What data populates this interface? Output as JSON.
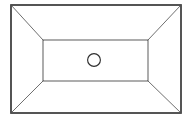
{
  "figure": {
    "background_color": "#ffffff",
    "width": 192,
    "height": 122,
    "line_color_outer": "#2b2b2b",
    "line_color_inner": "#4a4a4a",
    "line_color_taper": "#555555",
    "line_color_hole": "#2f2f2f"
  },
  "geometry": {
    "outer_rect": {
      "name": "outer-rim-rectangle",
      "x": 11,
      "y": 5,
      "width": 170,
      "height": 108,
      "corners": [
        [
          11,
          5
        ],
        [
          181,
          5
        ],
        [
          181,
          113
        ],
        [
          11,
          113
        ]
      ]
    },
    "inner_rect": {
      "name": "inner-base-rectangle",
      "x": 43,
      "y": 40,
      "width": 105,
      "height": 41,
      "corners": [
        [
          43,
          40
        ],
        [
          148,
          40
        ],
        [
          148,
          81
        ],
        [
          43,
          81
        ]
      ]
    },
    "taper_lines": [
      {
        "name": "taper-top-left",
        "x1": 11,
        "y1": 5,
        "x2": 43,
        "y2": 40
      },
      {
        "name": "taper-top-right",
        "x1": 181,
        "y1": 5,
        "x2": 148,
        "y2": 40
      },
      {
        "name": "taper-bottom-right",
        "x1": 181,
        "y1": 113,
        "x2": 148,
        "y2": 81
      },
      {
        "name": "taper-bottom-left",
        "x1": 11,
        "y1": 113,
        "x2": 43,
        "y2": 81
      }
    ],
    "center_hole": {
      "name": "center-drain-hole",
      "cx": 94,
      "cy": 60,
      "r": 6.4
    }
  },
  "labels": {
    "caption": ""
  }
}
